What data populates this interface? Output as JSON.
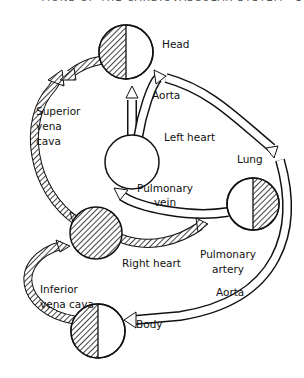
{
  "header": {
    "partial_text": "TIONS OF THE CARDIOVASCULAR SYSTEM   397"
  },
  "labels": {
    "head": "Head",
    "aorta_top": "Aorta",
    "superior_vena_cava": "Superior\nvena\ncava",
    "left_heart": "Left heart",
    "lung": "Lung",
    "pulmonary_vein": "Pulmonary\nvein",
    "right_heart": "Right heart",
    "pulmonary_artery": "Pulmonary\nartery",
    "inferior_vena_cava": "Inferior\nvena cava",
    "aorta_bottom": "Aorta",
    "body": "Body"
  },
  "colors": {
    "ink": "#111111",
    "background": "#ffffff"
  }
}
